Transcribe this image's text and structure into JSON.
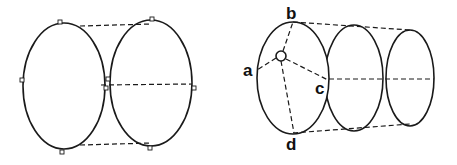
{
  "figure": {
    "left_panel": {
      "description": "Two adjacent ellipses joined by dashed tangent lines (top, middle, bottom) with small square markers",
      "ellipses": [
        {
          "cx": 64,
          "cy": 86,
          "rx": 41,
          "ry": 63
        },
        {
          "cx": 151,
          "cy": 83,
          "rx": 41,
          "ry": 63
        }
      ],
      "dashed_lines": [
        {
          "x1": 80,
          "y1": 26,
          "x2": 152,
          "y2": 24
        },
        {
          "x1": 101,
          "y1": 85,
          "x2": 192,
          "y2": 84
        },
        {
          "x1": 80,
          "y1": 145,
          "x2": 152,
          "y2": 143
        }
      ],
      "markers": [
        {
          "x": 60,
          "y": 22
        },
        {
          "x": 152,
          "y": 19
        },
        {
          "x": 22,
          "y": 80
        },
        {
          "x": 108,
          "y": 79
        },
        {
          "x": 106,
          "y": 88
        },
        {
          "x": 194,
          "y": 88
        },
        {
          "x": 62,
          "y": 152
        },
        {
          "x": 150,
          "y": 148
        }
      ]
    },
    "right_panel": {
      "description": "Three receding ellipses forming a cylinder; front ellipse has points a, b, c, d connected by dashed lines to a small central circle",
      "ellipses": [
        {
          "cx": 293,
          "cy": 78,
          "rx": 36,
          "ry": 56
        },
        {
          "cx": 354,
          "cy": 78,
          "rx": 29,
          "ry": 53
        },
        {
          "cx": 410,
          "cy": 78,
          "rx": 24,
          "ry": 48
        }
      ],
      "center_circle": {
        "cx": 281,
        "cy": 56,
        "r": 5
      },
      "labels": {
        "a": "a",
        "b": "b",
        "c": "c",
        "d": "d"
      }
    }
  }
}
